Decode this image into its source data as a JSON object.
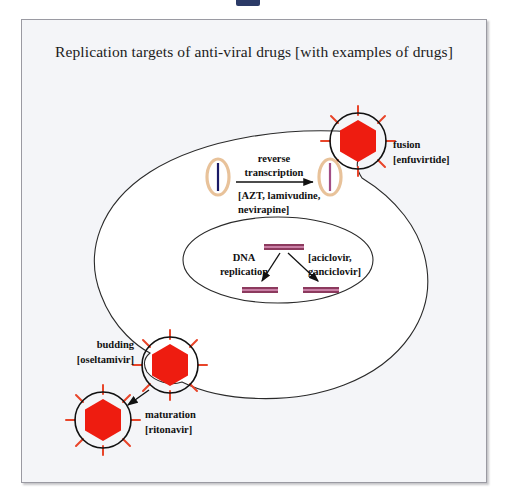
{
  "figure": {
    "title": "Replication targets of anti-viral drugs [with examples of drugs]",
    "background_color": "#f4f5f8",
    "border_color": "#9a9aa2"
  },
  "colors": {
    "virus_capsid": "#ee1c10",
    "virus_spike": "#e8452a",
    "virus_envelope": "#111111",
    "cell_membrane": "#2a2a2a",
    "nucleus_outline": "#2a2a2a",
    "cell_fill": "#ffffff",
    "capsid_oval_outline": "#e8c29a",
    "rna_strand": "#1a1a66",
    "dna_strand": "#a24d86",
    "dna_bar_dark": "#8c3a5e",
    "dna_bar_light": "#c97fa5",
    "text": "#111111"
  },
  "steps": [
    {
      "id": "fusion",
      "name": "fusion",
      "drugs": "[enfuvirtide]"
    },
    {
      "id": "reverse-transcription",
      "name_line1": "reverse",
      "name_line2": "transcription",
      "drugs_line1": "[AZT, lamivudine,",
      "drugs_line2": "nevirapine]"
    },
    {
      "id": "dna-replication",
      "name_line1": "DNA",
      "name_line2": "replication",
      "drugs_line1": "[aciclovir,",
      "drugs_line2": "ganciclovir]"
    },
    {
      "id": "budding",
      "name": "budding",
      "drugs": "[oseltamivir]"
    },
    {
      "id": "maturation",
      "name": "maturation",
      "drugs": "[ritonavir]"
    }
  ]
}
